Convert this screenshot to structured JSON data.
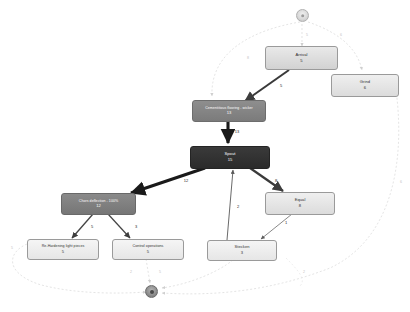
{
  "diagram": {
    "background_color": "#ffffff",
    "terminals": [
      {
        "id": "start",
        "name": "start-node",
        "shape": "circle"
      },
      {
        "id": "end",
        "name": "end-node",
        "shape": "circle"
      }
    ],
    "nodes": [
      {
        "id": "arrival",
        "label": "Arrival",
        "value": "5",
        "style": "light"
      },
      {
        "id": "grind",
        "label": "Grind",
        "value": "6",
        "style": "lighter"
      },
      {
        "id": "cementitious",
        "label": "Cementitious flooring - wicker",
        "value": "13",
        "style": "mid"
      },
      {
        "id": "spout",
        "label": "Spout",
        "value": "15",
        "style": "dark"
      },
      {
        "id": "chors",
        "label": "Chors deflection - 100%",
        "value": "12",
        "style": "midgrey"
      },
      {
        "id": "rehardening",
        "label": "Re-Hardening light pieces",
        "value": "5",
        "style": "palest"
      },
      {
        "id": "control",
        "label": "Control operations",
        "value": "5",
        "style": "palest"
      },
      {
        "id": "equal",
        "label": "Equal",
        "value": "8",
        "style": "lighter"
      },
      {
        "id": "stecken",
        "label": "Stecken",
        "value": "3",
        "style": "palest"
      }
    ],
    "edges": [
      {
        "from": "arrival",
        "to": "cementitious",
        "label": "5",
        "weight": "heavy"
      },
      {
        "from": "cementitious",
        "to": "spout",
        "label": "13",
        "weight": "heaviest"
      },
      {
        "from": "spout",
        "to": "chors",
        "label": "12",
        "weight": "heaviest"
      },
      {
        "from": "spout",
        "to": "equal",
        "label": "8",
        "weight": "heavy"
      },
      {
        "from": "stecken",
        "to": "spout",
        "label": "2",
        "weight": "thin"
      },
      {
        "from": "chors",
        "to": "rehardening",
        "label": "5",
        "weight": "medium"
      },
      {
        "from": "chors",
        "to": "control",
        "label": "3",
        "weight": "medium"
      },
      {
        "from": "equal",
        "to": "stecken",
        "label": "1",
        "weight": "thin"
      },
      {
        "from": "start",
        "to": "arrival",
        "label": "5",
        "weight": "dashed"
      },
      {
        "from": "start",
        "to": "grind",
        "label": "6",
        "weight": "dashed"
      },
      {
        "from": "start",
        "to": "cementitious",
        "label": "8",
        "weight": "dashed"
      },
      {
        "from": "grind",
        "to": "end",
        "label": "6",
        "weight": "dashed"
      },
      {
        "from": "rehardening",
        "to": "end",
        "label": "5",
        "weight": "dashed"
      },
      {
        "from": "control",
        "to": "end",
        "label": "5",
        "weight": "dashed"
      },
      {
        "from": "stecken",
        "to": "end",
        "label": "2",
        "weight": "dashed"
      }
    ]
  }
}
